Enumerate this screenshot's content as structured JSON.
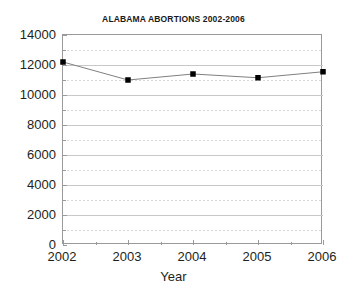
{
  "chart_data": {
    "type": "line",
    "title": "ALABAMA ABORTIONS 2002-2006",
    "xlabel": "Year",
    "ylabel": "",
    "categories": [
      "2002",
      "2003",
      "2004",
      "2005",
      "2006"
    ],
    "x": [
      2002,
      2003,
      2004,
      2005,
      2006
    ],
    "values": [
      12200,
      11000,
      11400,
      11150,
      11550
    ],
    "series": [
      {
        "name": "Abortions",
        "values": [
          12200,
          11000,
          11400,
          11150,
          11550
        ]
      }
    ],
    "ylim": [
      0,
      14000
    ],
    "xlim": [
      2002,
      2006
    ],
    "y_ticks": [
      0,
      2000,
      4000,
      6000,
      8000,
      10000,
      12000,
      14000
    ],
    "y_tick_labels": [
      "0",
      "2000",
      "4000",
      "6000",
      "8000",
      "10000",
      "12000",
      "14000"
    ],
    "y_minor_ticks": [
      1000,
      3000,
      5000,
      7000,
      9000,
      11000,
      13000
    ],
    "x_ticks": [
      2002,
      2003,
      2004,
      2005,
      2006
    ],
    "x_tick_labels": [
      "2002",
      "2003",
      "2004",
      "2005",
      "2006"
    ],
    "grid": true,
    "grid_major_style": "solid",
    "grid_minor_style": "dashed",
    "legend": false,
    "marker": "square",
    "marker_color": "#000000",
    "line_color": "#808080",
    "grid_major_color": "#c8c8c8",
    "grid_minor_color": "#d8d8d8",
    "axis_color": "#9a9a9a",
    "background_color": "#ffffff",
    "text_color": "#231f20"
  }
}
